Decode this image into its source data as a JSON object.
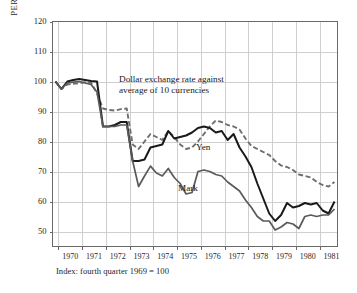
{
  "chart_data": {
    "type": "line",
    "title": "",
    "annotation": "Dollar exchange rate against\naverage of 10 currencies",
    "annotation_line1": "Dollar exchange rate against",
    "annotation_line2": "average of 10 currencies",
    "footnote": "Index: fourth quarter 1969 = 100",
    "ylabel": "PERCENT CHANGE*",
    "xlabel": "",
    "ylim": [
      45,
      120
    ],
    "xlim": [
      1969.75,
      1981.75
    ],
    "grid": true,
    "legend_position": "inline-labels",
    "yticks": [
      120,
      110,
      100,
      90,
      80,
      70,
      60,
      50
    ],
    "xticks": [
      1970,
      1971,
      1972,
      1973,
      1974,
      1975,
      1976,
      1977,
      1978,
      1979,
      1980,
      1981
    ],
    "x": [
      1969.875,
      1970.125,
      1970.375,
      1970.625,
      1970.875,
      1971.125,
      1971.375,
      1971.625,
      1971.875,
      1972.125,
      1972.375,
      1972.625,
      1972.875,
      1973.125,
      1973.375,
      1973.625,
      1973.875,
      1974.125,
      1974.375,
      1974.625,
      1974.875,
      1975.125,
      1975.375,
      1975.625,
      1975.875,
      1976.125,
      1976.375,
      1976.625,
      1976.875,
      1977.125,
      1977.375,
      1977.625,
      1977.875,
      1978.125,
      1978.375,
      1978.625,
      1978.875,
      1979.125,
      1979.375,
      1979.625,
      1979.875,
      1980.125,
      1980.375,
      1980.625,
      1980.875,
      1981.125,
      1981.375,
      1981.625
    ],
    "series": [
      {
        "name": "Average of 10 currencies",
        "style": "dashed",
        "color": "#6e6e6e",
        "values": [
          100.0,
          97.5,
          99.0,
          99.2,
          99.4,
          99.8,
          99.6,
          96.0,
          91.0,
          90.5,
          90.3,
          90.8,
          91.0,
          79.0,
          77.5,
          80.0,
          82.5,
          81.5,
          80.5,
          83.5,
          81.5,
          79.0,
          77.5,
          78.0,
          80.0,
          82.5,
          85.0,
          87.0,
          86.5,
          85.5,
          85.0,
          84.0,
          81.0,
          78.5,
          77.5,
          76.5,
          75.5,
          73.5,
          72.0,
          71.5,
          70.5,
          69.0,
          68.5,
          68.0,
          66.5,
          65.5,
          65.0,
          66.5
        ]
      },
      {
        "name": "Yen",
        "style": "solid",
        "color": "#1a1a1a",
        "values": [
          100.0,
          97.5,
          100.0,
          100.5,
          100.8,
          100.5,
          100.2,
          100.0,
          85.0,
          85.0,
          85.5,
          86.5,
          86.5,
          73.5,
          73.5,
          74.0,
          78.0,
          78.5,
          79.0,
          83.5,
          81.0,
          81.5,
          82.0,
          83.0,
          84.5,
          85.0,
          84.5,
          83.0,
          83.5,
          80.5,
          82.5,
          78.0,
          75.0,
          71.5,
          66.0,
          61.0,
          56.0,
          53.5,
          55.5,
          59.5,
          58.0,
          58.5,
          59.5,
          59.0,
          59.5,
          57.0,
          56.0,
          60.0
        ]
      },
      {
        "name": "Mark",
        "style": "solid",
        "color": "#5a5a5a",
        "values": [
          100.0,
          97.5,
          99.5,
          99.8,
          100.0,
          99.5,
          99.0,
          96.5,
          85.0,
          85.0,
          85.0,
          85.5,
          85.5,
          73.5,
          65.0,
          68.5,
          71.8,
          69.5,
          68.5,
          71.0,
          68.0,
          66.0,
          62.5,
          63.0,
          70.0,
          70.5,
          70.0,
          69.0,
          68.5,
          66.5,
          65.0,
          63.5,
          60.5,
          58.0,
          55.0,
          53.5,
          53.5,
          50.5,
          51.5,
          53.0,
          52.5,
          51.0,
          55.0,
          55.5,
          55.0,
          55.5,
          55.5,
          57.5
        ]
      }
    ]
  },
  "axis": {
    "ytick_labels": [
      "120",
      "110",
      "100",
      "90",
      "80",
      "70",
      "60",
      "50"
    ],
    "xtick_labels": [
      "1970",
      "1971",
      "1972",
      "1973",
      "1974",
      "1975",
      "1976",
      "1977",
      "1978",
      "1979",
      "1980",
      "1981"
    ],
    "ylabel": "PERCENT CHANGE*"
  },
  "labels": {
    "yen": "Yen",
    "mark": "Mark"
  },
  "colors": {
    "background": "#ffffff",
    "frame": "#6a6a6a",
    "grid": "#cfcfcf",
    "yen_line": "#1a1a1a",
    "mark_line": "#5a5a5a",
    "average_line": "#6e6e6e",
    "text": "#1a1a1a"
  }
}
